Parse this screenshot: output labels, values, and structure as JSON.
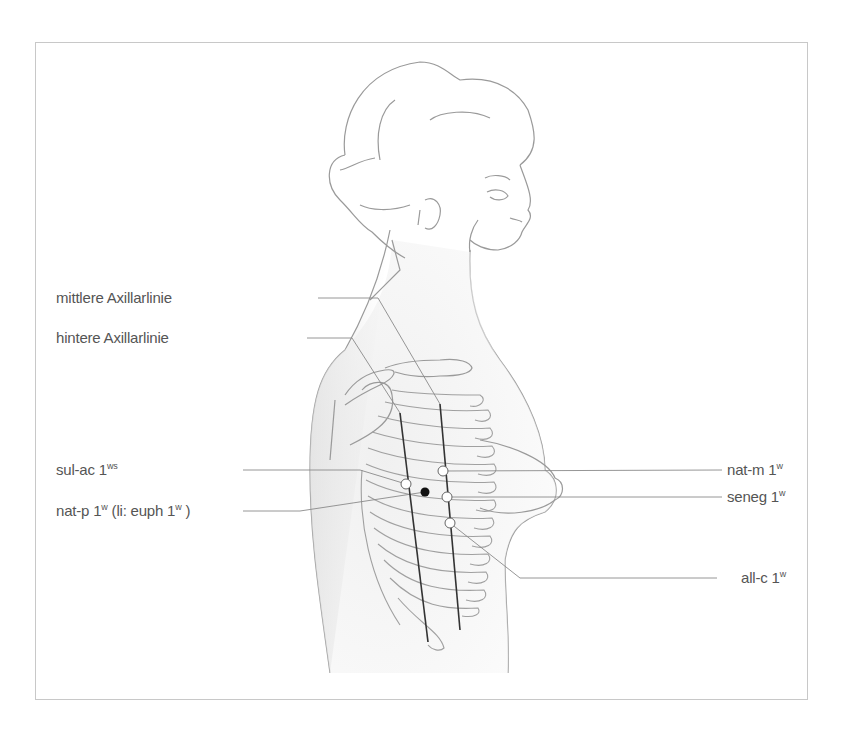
{
  "figure": {
    "colors": {
      "frame": "#c8c8c8",
      "outline": "#9a9a9a",
      "leader": "#8a8a8a",
      "axillary_line": "#333333",
      "text": "#555555",
      "point_open": "#ffffff",
      "point_filled": "#111111"
    }
  },
  "labels": {
    "mittlere_axillarlinie": {
      "text": "mittlere Axillarlinie"
    },
    "hintere_axillarlinie": {
      "text": "hintere Axillarlinie"
    },
    "sul_ac": {
      "text": "sul-ac 1",
      "sup": "ws"
    },
    "nat_p": {
      "text": "nat-p 1",
      "sup": "w",
      "text2": " (li: euph 1",
      "sup2": "w",
      "text3": " )"
    },
    "nat_m": {
      "text": "nat-m 1",
      "sup": "w"
    },
    "seneg": {
      "text": "seneg 1",
      "sup": "w"
    },
    "all_c": {
      "text": "all-c 1",
      "sup": "w"
    }
  },
  "points": [
    {
      "id": "sul-ac",
      "type": "open",
      "x": 406,
      "y": 484
    },
    {
      "id": "nat-p",
      "type": "filled",
      "x": 425,
      "y": 492
    },
    {
      "id": "nat-m",
      "type": "open",
      "x": 443,
      "y": 471
    },
    {
      "id": "seneg",
      "type": "open",
      "x": 447,
      "y": 497
    },
    {
      "id": "all-c",
      "type": "open",
      "x": 450,
      "y": 523
    }
  ]
}
